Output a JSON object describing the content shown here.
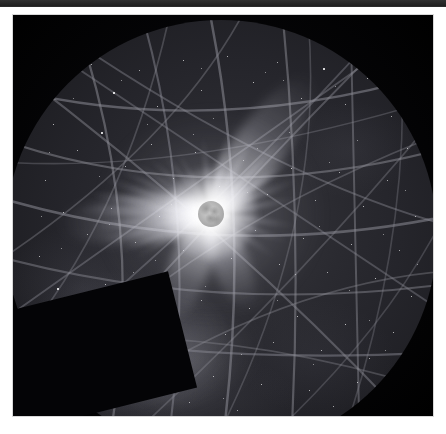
{
  "page": {
    "background_color": "#ffffff",
    "width": 446,
    "height": 434
  },
  "header_bar": {
    "name": "page-header-strip",
    "color": "#2b2b2b",
    "height_px": 7,
    "label": ""
  },
  "figure": {
    "name": "eclipse-allsky-photograph",
    "frame": {
      "left": 13,
      "top": 15,
      "width": 420,
      "height": 401
    },
    "sky_background_color": "#26262c",
    "outside_circle_color": "#040406",
    "caption": ""
  },
  "allsky_disk": {
    "name": "all-sky-circular-field",
    "center_x_px": 208,
    "center_y_px": 200,
    "radius_px": 216,
    "horizon_color": "#12121a"
  },
  "corona": {
    "name": "solar-corona",
    "center_x_px": 206,
    "center_y_px": 194,
    "moon_disk_radius_px": 13,
    "moon_disk_color": "#b9b9b9",
    "glow_color": "#ffffff",
    "streamer_count": 22,
    "streamers": [
      {
        "angle_deg": 178,
        "length_px": 132,
        "width_px": 10,
        "opacity": 0.95
      },
      {
        "angle_deg": 186,
        "length_px": 124,
        "width_px": 9,
        "opacity": 0.9
      },
      {
        "angle_deg": 194,
        "length_px": 112,
        "width_px": 8,
        "opacity": 0.85
      },
      {
        "angle_deg": 202,
        "length_px": 100,
        "width_px": 7,
        "opacity": 0.78
      },
      {
        "angle_deg": 210,
        "length_px": 88,
        "width_px": 6,
        "opacity": 0.7
      },
      {
        "angle_deg": 170,
        "length_px": 126,
        "width_px": 9,
        "opacity": 0.92
      },
      {
        "angle_deg": 162,
        "length_px": 114,
        "width_px": 8,
        "opacity": 0.86
      },
      {
        "angle_deg": 154,
        "length_px": 104,
        "width_px": 7,
        "opacity": 0.8
      },
      {
        "angle_deg": 146,
        "length_px": 92,
        "width_px": 6,
        "opacity": 0.72
      },
      {
        "angle_deg": 138,
        "length_px": 84,
        "width_px": 6,
        "opacity": 0.66
      },
      {
        "angle_deg": 128,
        "length_px": 78,
        "width_px": 6,
        "opacity": 0.6
      },
      {
        "angle_deg": 118,
        "length_px": 74,
        "width_px": 5,
        "opacity": 0.55
      },
      {
        "angle_deg": 96,
        "length_px": 80,
        "width_px": 6,
        "opacity": 0.58
      },
      {
        "angle_deg": 78,
        "length_px": 86,
        "width_px": 6,
        "opacity": 0.6
      },
      {
        "angle_deg": 62,
        "length_px": 96,
        "width_px": 7,
        "opacity": 0.66
      },
      {
        "angle_deg": 46,
        "length_px": 112,
        "width_px": 8,
        "opacity": 0.74
      },
      {
        "angle_deg": 34,
        "length_px": 104,
        "width_px": 7,
        "opacity": 0.7
      },
      {
        "angle_deg": 22,
        "length_px": 96,
        "width_px": 7,
        "opacity": 0.66
      },
      {
        "angle_deg": 10,
        "length_px": 92,
        "width_px": 6,
        "opacity": 0.62
      },
      {
        "angle_deg": 352,
        "length_px": 88,
        "width_px": 6,
        "opacity": 0.6
      },
      {
        "angle_deg": 340,
        "length_px": 84,
        "width_px": 6,
        "opacity": 0.56
      },
      {
        "angle_deg": 326,
        "length_px": 78,
        "width_px": 6,
        "opacity": 0.52
      }
    ],
    "broad_streamers": [
      {
        "angle_deg": 54,
        "length_px": 168,
        "width_px": 52,
        "label": "north-east-polar-streamer"
      },
      {
        "angle_deg": 184,
        "length_px": 152,
        "width_px": 48,
        "label": "west-equatorial-streamer"
      },
      {
        "angle_deg": 248,
        "length_px": 120,
        "width_px": 40,
        "label": "south-west-streamer"
      },
      {
        "angle_deg": 292,
        "length_px": 104,
        "width_px": 36,
        "label": "south-streamer"
      }
    ],
    "prominences": [
      {
        "x_px": 16,
        "y_px": 2,
        "size_px": 6
      },
      {
        "x_px": -4,
        "y_px": 16,
        "size_px": 5
      },
      {
        "x_px": -18,
        "y_px": -6,
        "size_px": 5
      }
    ]
  },
  "trails": {
    "name": "satellite-and-aircraft-trail-lines",
    "stroke_color": "#8d8d96",
    "stroke_opacity": 0.55,
    "count": 26,
    "arcs": [
      {
        "d": "M -30 60 Q 210 130 470 40",
        "w": 2.4,
        "o": 0.55
      },
      {
        "d": "M -30 110 Q 200 200 470 120",
        "w": 2.2,
        "o": 0.5
      },
      {
        "d": "M -30 170 Q 215 250 470 190",
        "w": 2.6,
        "o": 0.55
      },
      {
        "d": "M -30 230 Q 210 300 470 260",
        "w": 2.0,
        "o": 0.45
      },
      {
        "d": "M -30 300 Q 200 350 470 330",
        "w": 2.2,
        "o": 0.48
      },
      {
        "d": "M 60 -30 Q 150 210 100 440",
        "w": 2.3,
        "o": 0.52
      },
      {
        "d": "M 130 -30 Q 200 200 160 440",
        "w": 2.1,
        "o": 0.48
      },
      {
        "d": "M 200 -30 Q 250 200 215 440",
        "w": 2.5,
        "o": 0.55
      },
      {
        "d": "M 275 -30 Q 300 200 285 440",
        "w": 2.2,
        "o": 0.5
      },
      {
        "d": "M 345 -30 Q 350 200 355 440",
        "w": 2.0,
        "o": 0.45
      },
      {
        "d": "M -30 20 Q 230 210 430 430",
        "w": 2.1,
        "o": 0.46
      },
      {
        "d": "M -30 -20 L 450 300",
        "w": 1.8,
        "o": 0.4
      },
      {
        "d": "M 450 -20 L -30 320",
        "w": 1.9,
        "o": 0.42
      },
      {
        "d": "M 430 -30 Q 200 200 10 420",
        "w": 2.0,
        "o": 0.44
      },
      {
        "d": "M -20 380 Q 230 180 400 -20",
        "w": 1.8,
        "o": 0.4
      },
      {
        "d": "M 10 -20 Q 260 160 460 210",
        "w": 1.9,
        "o": 0.42
      },
      {
        "d": "M 30 430 Q 250 260 460 250",
        "w": 1.8,
        "o": 0.38
      },
      {
        "d": "M -20 250 Q 180 120 250 -30",
        "w": 1.7,
        "o": 0.38
      },
      {
        "d": "M -20 440 Q 120 240 420 120",
        "w": 1.8,
        "o": 0.38
      },
      {
        "d": "M 100 440 Q 300 260 460 60",
        "w": 1.7,
        "o": 0.36
      },
      {
        "d": "M 170 -30 Q 120 220 -20 360",
        "w": 1.7,
        "o": 0.36
      },
      {
        "d": "M 300 -30 Q 330 200 200 440",
        "w": 1.6,
        "o": 0.34
      },
      {
        "d": "M -30 140 Q 180 160 460 70",
        "w": 1.6,
        "o": 0.34
      },
      {
        "d": "M -30 330 Q 190 290 460 380",
        "w": 1.7,
        "o": 0.36
      },
      {
        "d": "M 390 -30 Q 420 190 330 440",
        "w": 1.6,
        "o": 0.32
      },
      {
        "d": "M 240 440 Q 400 300 460 150",
        "w": 1.6,
        "o": 0.32
      }
    ]
  },
  "stars": {
    "name": "star-field",
    "color": "#ffffff",
    "count": 120,
    "points": [
      [
        62,
        58,
        1.4
      ],
      [
        86,
        44,
        1.1
      ],
      [
        108,
        72,
        1.6
      ],
      [
        134,
        50,
        1.0
      ],
      [
        152,
        86,
        1.2
      ],
      [
        178,
        40,
        1.3
      ],
      [
        196,
        70,
        1.0
      ],
      [
        222,
        36,
        1.1
      ],
      [
        248,
        62,
        1.4
      ],
      [
        272,
        42,
        1.0
      ],
      [
        296,
        78,
        1.2
      ],
      [
        318,
        48,
        1.5
      ],
      [
        340,
        84,
        1.1
      ],
      [
        362,
        58,
        1.2
      ],
      [
        386,
        96,
        1.0
      ],
      [
        48,
        104,
        1.3
      ],
      [
        72,
        130,
        1.0
      ],
      [
        96,
        112,
        1.5
      ],
      [
        120,
        146,
        1.1
      ],
      [
        146,
        124,
        1.2
      ],
      [
        168,
        158,
        1.0
      ],
      [
        190,
        132,
        1.3
      ],
      [
        214,
        166,
        1.1
      ],
      [
        238,
        140,
        1.0
      ],
      [
        262,
        174,
        1.2
      ],
      [
        286,
        148,
        1.4
      ],
      [
        310,
        180,
        1.0
      ],
      [
        334,
        152,
        1.1
      ],
      [
        358,
        186,
        1.3
      ],
      [
        382,
        160,
        1.0
      ],
      [
        402,
        128,
        1.2
      ],
      [
        40,
        160,
        1.1
      ],
      [
        58,
        192,
        1.4
      ],
      [
        82,
        214,
        1.0
      ],
      [
        106,
        188,
        1.2
      ],
      [
        130,
        222,
        1.1
      ],
      [
        154,
        196,
        1.3
      ],
      [
        178,
        230,
        1.0
      ],
      [
        202,
        204,
        1.1
      ],
      [
        226,
        238,
        1.2
      ],
      [
        250,
        210,
        1.0
      ],
      [
        274,
        244,
        1.3
      ],
      [
        298,
        218,
        1.1
      ],
      [
        322,
        252,
        1.0
      ],
      [
        346,
        224,
        1.2
      ],
      [
        370,
        258,
        1.4
      ],
      [
        394,
        230,
        1.0
      ],
      [
        410,
        196,
        1.1
      ],
      [
        34,
        236,
        1.2
      ],
      [
        52,
        268,
        1.5
      ],
      [
        76,
        290,
        1.1
      ],
      [
        100,
        264,
        1.3
      ],
      [
        124,
        298,
        1.0
      ],
      [
        148,
        272,
        1.2
      ],
      [
        172,
        306,
        1.4
      ],
      [
        196,
        280,
        1.0
      ],
      [
        220,
        314,
        1.1
      ],
      [
        244,
        288,
        1.3
      ],
      [
        268,
        322,
        1.0
      ],
      [
        292,
        296,
        1.2
      ],
      [
        316,
        330,
        1.1
      ],
      [
        340,
        304,
        1.4
      ],
      [
        364,
        338,
        1.0
      ],
      [
        388,
        312,
        1.2
      ],
      [
        406,
        276,
        1.1
      ],
      [
        46,
        314,
        1.0
      ],
      [
        64,
        344,
        1.3
      ],
      [
        88,
        366,
        1.1
      ],
      [
        112,
        340,
        1.2
      ],
      [
        136,
        374,
        1.0
      ],
      [
        160,
        348,
        1.4
      ],
      [
        184,
        382,
        1.1
      ],
      [
        208,
        356,
        1.2
      ],
      [
        232,
        390,
        1.0
      ],
      [
        256,
        364,
        1.3
      ],
      [
        280,
        396,
        1.1
      ],
      [
        304,
        370,
        1.2
      ],
      [
        328,
        386,
        1.0
      ],
      [
        352,
        362,
        1.3
      ],
      [
        376,
        390,
        1.1
      ],
      [
        398,
        352,
        1.2
      ],
      [
        68,
        78,
        0.9
      ],
      [
        142,
        104,
        0.9
      ],
      [
        208,
        98,
        0.9
      ],
      [
        284,
        112,
        0.9
      ],
      [
        352,
        120,
        0.9
      ],
      [
        94,
        156,
        0.9
      ],
      [
        166,
        184,
        0.9
      ],
      [
        242,
        172,
        0.9
      ],
      [
        314,
        206,
        0.9
      ],
      [
        378,
        214,
        0.9
      ],
      [
        56,
        228,
        0.9
      ],
      [
        128,
        252,
        0.9
      ],
      [
        200,
        266,
        0.9
      ],
      [
        272,
        280,
        0.9
      ],
      [
        344,
        270,
        0.9
      ],
      [
        92,
        326,
        0.9
      ],
      [
        164,
        318,
        0.9
      ],
      [
        236,
        334,
        0.9
      ],
      [
        308,
        344,
        0.9
      ],
      [
        380,
        330,
        0.9
      ],
      [
        116,
        60,
        0.8
      ],
      [
        260,
        52,
        0.8
      ],
      [
        330,
        66,
        0.8
      ],
      [
        44,
        132,
        0.8
      ],
      [
        400,
        170,
        0.8
      ],
      [
        150,
        240,
        0.8
      ],
      [
        290,
        254,
        0.8
      ],
      [
        72,
        362,
        0.8
      ],
      [
        218,
        378,
        0.8
      ],
      [
        364,
        300,
        0.8
      ],
      [
        188,
        114,
        0.8
      ],
      [
        252,
        128,
        0.8
      ],
      [
        104,
        204,
        0.8
      ],
      [
        324,
        142,
        0.8
      ],
      [
        36,
        196,
        0.8
      ],
      [
        412,
        244,
        0.8
      ],
      [
        142,
        400,
        0.8
      ],
      [
        278,
        60,
        0.8
      ],
      [
        196,
        48,
        0.8
      ]
    ]
  }
}
